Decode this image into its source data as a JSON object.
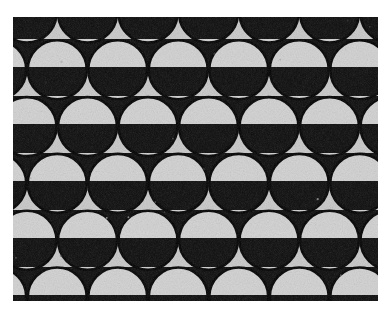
{
  "document": {
    "title": "Packed Circles Contrast-Banded Pattern",
    "kind": "monochrome-photograph",
    "canvas_width": 389,
    "canvas_height": 322,
    "background_color": "#ffffff"
  },
  "figure": {
    "name": "packed-circle-array",
    "x": 13,
    "y": 17,
    "width": 365,
    "height": 284,
    "border": "none"
  },
  "palette": {
    "light_gray": "#c9c9c9",
    "light_gray_alt": "#d2d2d2",
    "dark": "#0b0b0b",
    "dark_alt": "#141414",
    "outline": "#000000",
    "paper": "#ffffff"
  },
  "pattern": {
    "type": "offset-circle-lattice",
    "circle_diameter": 59,
    "circle_radius": 29.5,
    "column_pitch": 60.5,
    "row_pitch": 56.8,
    "row_offset_fraction": 0.5,
    "outline_width": 2.6,
    "columns": 7,
    "rows": 6,
    "origin_x": 14,
    "origin_y": -4,
    "band_period": 56.8,
    "band_phase": 28.0,
    "band_count": 6,
    "bands": [
      {
        "index": 0,
        "start_y": -6,
        "end_y": 22,
        "mode": "light-ground-dark-disc"
      },
      {
        "index": 1,
        "start_y": 22,
        "end_y": 50,
        "mode": "dark-ground-light-disc"
      },
      {
        "index": 2,
        "start_y": 50,
        "end_y": 79,
        "mode": "light-ground-dark-disc"
      },
      {
        "index": 3,
        "start_y": 79,
        "end_y": 107,
        "mode": "dark-ground-light-disc"
      },
      {
        "index": 4,
        "start_y": 107,
        "end_y": 136,
        "mode": "light-ground-dark-disc"
      },
      {
        "index": 5,
        "start_y": 136,
        "end_y": 164,
        "mode": "dark-ground-light-disc"
      },
      {
        "index": 6,
        "start_y": 164,
        "end_y": 193,
        "mode": "light-ground-dark-disc"
      },
      {
        "index": 7,
        "start_y": 193,
        "end_y": 221,
        "mode": "dark-ground-light-disc"
      },
      {
        "index": 8,
        "start_y": 221,
        "end_y": 250,
        "mode": "light-ground-dark-disc"
      },
      {
        "index": 9,
        "start_y": 250,
        "end_y": 278,
        "mode": "dark-ground-light-disc"
      },
      {
        "index": 10,
        "start_y": 278,
        "end_y": 306,
        "mode": "light-ground-dark-disc"
      }
    ]
  },
  "texture": {
    "grain": "fine photographic film grain",
    "grain_opacity": 0.3,
    "speckle_count": 26
  }
}
